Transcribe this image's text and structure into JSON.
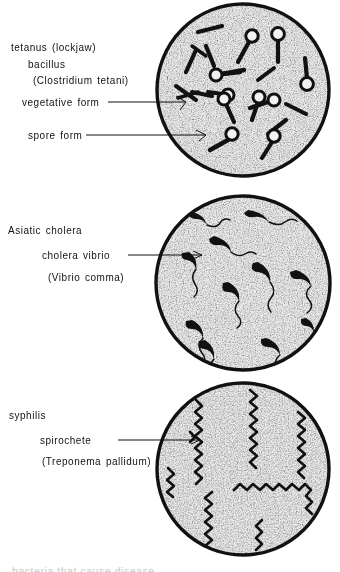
{
  "plate": {
    "title": "Pathogenic bacteria microscope plate",
    "background_color": "#ffffff",
    "ink_color": "#111111",
    "field_fill": "#efefef",
    "stipple_color": "#3a3a3a"
  },
  "panels": [
    {
      "id": "tetanus",
      "disease_label": "tetanus (lockjaw)",
      "organism_label": "bacillus",
      "species_label": "(Clostridium tetani)",
      "callouts": [
        {
          "label": "vegetative form"
        },
        {
          "label": "spore form"
        }
      ],
      "field": {
        "cx": 243,
        "cy": 90,
        "r": 87,
        "morphology": "rod-with-terminal-spore",
        "organism_count": 18
      }
    },
    {
      "id": "cholera",
      "disease_label": "Asiatic cholera",
      "organism_label": "cholera vibrio",
      "species_label": "(Vibrio comma)",
      "callouts": [
        {
          "label": "cholera vibrio"
        }
      ],
      "field": {
        "cx": 243,
        "cy": 283,
        "r": 89,
        "morphology": "comma-shaped-with-polar-flagellum",
        "organism_count": 11
      }
    },
    {
      "id": "syphilis",
      "disease_label": "syphilis",
      "organism_label": "spirochete",
      "species_label": "(Treponema pallidum)",
      "callouts": [
        {
          "label": "spirochete"
        }
      ],
      "field": {
        "cx": 243,
        "cy": 469,
        "r": 87,
        "morphology": "helical-spirochete",
        "organism_count": 8
      }
    }
  ],
  "footer": {
    "cut_off_text": "bacteria that cause disease"
  }
}
